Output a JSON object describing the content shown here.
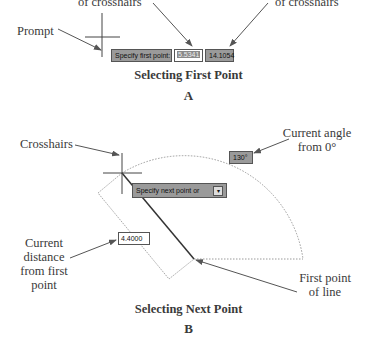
{
  "panel_a": {
    "labels": {
      "x_coord": "of crosshairs",
      "y_coord": "of crosshairs",
      "prompt": "Prompt"
    },
    "tooltip": {
      "prompt_text": "Specify first point:",
      "x_value": "5.5341",
      "y_value": "14.1054"
    },
    "caption": "Selecting First Point",
    "letter": "A"
  },
  "panel_b": {
    "labels": {
      "crosshairs": "Crosshairs",
      "angle_line1": "Current angle",
      "angle_line2": "from 0°",
      "distance_line1": "Current",
      "distance_line2": "distance",
      "distance_line3": "from first",
      "distance_line4": "point",
      "first_point_line1": "First point",
      "first_point_line2": "of line"
    },
    "tooltip": {
      "prompt_text": "Specify next point or",
      "dropdown_icon": "down-arrow-icon"
    },
    "angle_value": "130°",
    "distance_value": "4.4000",
    "caption": "Selecting Next Point",
    "letter": "B"
  },
  "colors": {
    "tooltip_bg": "#9a9a9a",
    "line": "#444444",
    "dotted": "#9a9a9a",
    "text": "#3a3a3a"
  }
}
